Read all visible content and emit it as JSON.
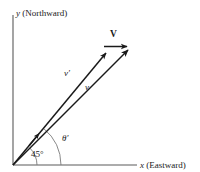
{
  "figure": {
    "background_color": "#ffffff",
    "stroke_color": "#1a1a1a",
    "axis_color": "#555555"
  },
  "axes": {
    "y": {
      "symbol": "y",
      "name": "(Northward)",
      "full_label": "y (Northward)"
    },
    "x": {
      "symbol": "x",
      "name": "(Eastward)",
      "full_label": "x (Eastward)"
    },
    "origin": {
      "x": 13,
      "y": 165
    },
    "y_top": {
      "x": 13,
      "y": 15
    },
    "x_right": {
      "x": 137,
      "y": 165
    }
  },
  "vectors": [
    {
      "id": "v-prime",
      "label": "v′",
      "style": "italic",
      "from": {
        "x": 13,
        "y": 165
      },
      "to": {
        "x": 106,
        "y": 53
      },
      "angle_deg": 50.3,
      "label_pos": {
        "x": 65,
        "y": 72
      }
    },
    {
      "id": "v",
      "label": "v",
      "style": "italic",
      "from": {
        "x": 13,
        "y": 165
      },
      "to": {
        "x": 128,
        "y": 50
      },
      "angle_deg": 45,
      "label_pos": {
        "x": 86,
        "y": 85
      }
    },
    {
      "id": "V-capital",
      "label": "V",
      "style": "bold",
      "from": {
        "x": 106,
        "y": 47
      },
      "to": {
        "x": 127,
        "y": 47
      },
      "angle_deg": 0,
      "label_pos": {
        "x": 110,
        "y": 26
      }
    }
  ],
  "angles": [
    {
      "id": "angle-45",
      "label": "45°",
      "value": 45,
      "unit": "degrees",
      "radius": 22,
      "label_pos": {
        "x": 30,
        "y": 150
      }
    },
    {
      "id": "angle-theta-prime",
      "label": "θ′",
      "radius": 47,
      "label_pos": {
        "x": 62,
        "y": 134
      }
    }
  ]
}
